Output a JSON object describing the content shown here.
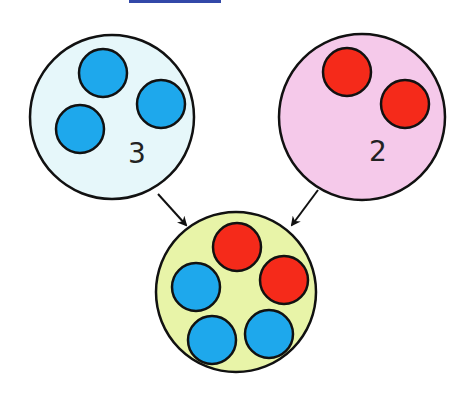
{
  "diagram": {
    "type": "addition-sets",
    "colors": {
      "blue_dot": "#1ea8ec",
      "red_dot": "#f52a1a",
      "left_set_fill": "#e6f7fa",
      "right_set_fill": "#f5c9ea",
      "result_set_fill": "#e8f4a8",
      "outline": "#111111",
      "top_bar": "#3248a8"
    },
    "left_set": {
      "count_label": "3",
      "dots": 3,
      "dot_color": "blue"
    },
    "right_set": {
      "count_label": "2",
      "dots": 2,
      "dot_color": "red"
    },
    "result_set": {
      "blue_dots": 3,
      "red_dots": 2
    }
  }
}
